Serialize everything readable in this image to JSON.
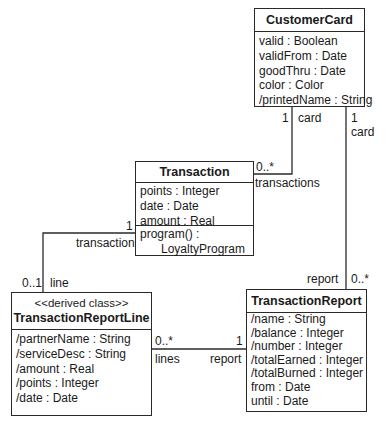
{
  "classes": {
    "customerCard": {
      "name": "CustomerCard",
      "attributes": [
        "valid : Boolean",
        "validFrom : Date",
        "goodThru : Date",
        "color : Color",
        "/printedName : String"
      ]
    },
    "transaction": {
      "name": "Transaction",
      "attributes": [
        "points : Integer",
        "date : Date",
        "amount : Real"
      ],
      "operations": [
        "program() :",
        "LoyaltyProgram"
      ]
    },
    "transactionReportLine": {
      "stereotype": "<<derived class>>",
      "name": "TransactionReportLine",
      "attributes": [
        "/partnerName : String",
        "/serviceDesc : String",
        "/amount : Real",
        "/points : Integer",
        "/date : Date"
      ]
    },
    "transactionReport": {
      "name": "TransactionReport",
      "attributes": [
        "/name : String",
        "/balance : Integer",
        "/number : Integer",
        "/totalEarned : Integer",
        "/totalBurned : Integer",
        "from : Date",
        "until : Date"
      ]
    }
  },
  "associations": {
    "card_transactions": {
      "card_multiplicity": "1",
      "card_role": "card",
      "transactions_multiplicity": "0..*",
      "transactions_role": "transactions"
    },
    "card_report": {
      "card_multiplicity": "1",
      "card_role": "card",
      "report_multiplicity": "0..*",
      "report_role": "report"
    },
    "transaction_line": {
      "transaction_multiplicity": "1",
      "transaction_role": "transaction",
      "line_multiplicity": "0..1",
      "line_role": "line"
    },
    "lines_report": {
      "lines_multiplicity": "0..*",
      "lines_role": "lines",
      "report_multiplicity": "1",
      "report_role": "report"
    }
  }
}
